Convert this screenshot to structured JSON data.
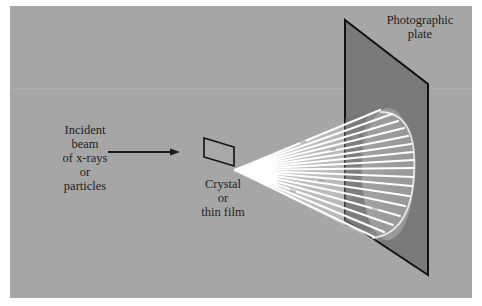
{
  "figure": {
    "colors": {
      "background": "#a6a6a6",
      "plate_fill": "#7a7a7a",
      "outline": "#111111",
      "beam": "#ffffff",
      "text": "#1e1e1e"
    },
    "labels": {
      "incident": {
        "lines": [
          "Incident",
          "beam",
          "of x-rays",
          "or",
          "particles"
        ]
      },
      "crystal": {
        "lines": [
          "Crystal",
          "or",
          "thin film"
        ]
      },
      "plate": {
        "lines": [
          "Photographic",
          "plate"
        ]
      }
    },
    "components": [
      "incident-beam-arrow",
      "crystal-sample",
      "diffracted-cone",
      "photographic-plate"
    ]
  }
}
